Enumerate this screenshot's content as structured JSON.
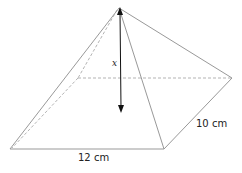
{
  "diagram": {
    "type": "rectangular pyramid",
    "labels": {
      "height": "x",
      "base_length": "12 cm",
      "base_width": "10 cm"
    },
    "colors": {
      "edge": "#999999",
      "hidden_edge": "#aaaaaa",
      "arrow": "#111111"
    }
  }
}
